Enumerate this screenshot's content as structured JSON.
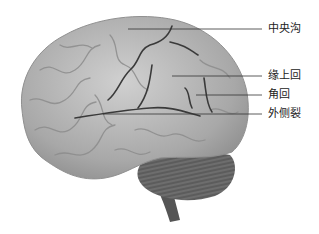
{
  "figure": {
    "labels": [
      {
        "id": "central-sulcus",
        "text": "中央沟",
        "x": 268,
        "y": 25
      },
      {
        "id": "supramarginal-gyrus",
        "text": "缘上回",
        "x": 268,
        "y": 70
      },
      {
        "id": "angular-gyrus",
        "text": "角回",
        "x": 268,
        "y": 90
      },
      {
        "id": "lateral-fissure",
        "text": "外侧裂",
        "x": 268,
        "y": 109
      }
    ],
    "colors": {
      "brain_fill": "#a9a9a9",
      "brain_highlight": "#d4d4d4",
      "sulcus": "#3a3a3a",
      "cerebellum": "#5a5a5a",
      "leader_line": "#333333"
    }
  }
}
